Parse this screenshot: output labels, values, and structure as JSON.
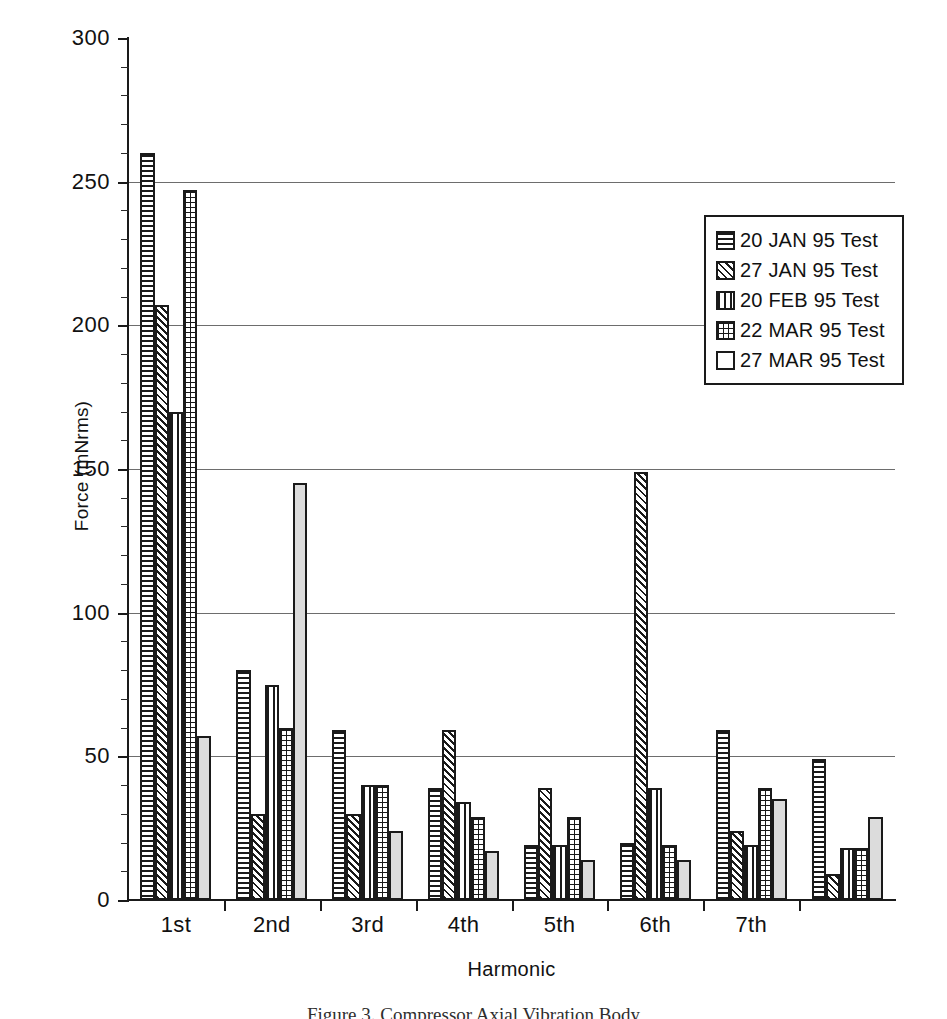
{
  "chart_data": {
    "type": "bar",
    "title": "",
    "xlabel": "Harmonic",
    "ylabel": "Force (mNrms)",
    "ylim": [
      0,
      300
    ],
    "ytick_values": [
      0,
      50,
      100,
      150,
      200,
      250,
      300
    ],
    "ytick_labels": [
      "0",
      "50",
      "100",
      "150",
      "200",
      "250",
      "300"
    ],
    "ytick_minor_step": 10,
    "grid": "horizontal",
    "legend_position": "upper-right",
    "categories": [
      "1st",
      "2nd",
      "3rd",
      "4th",
      "5th",
      "6th",
      "7th",
      ""
    ],
    "series": [
      {
        "name": "20 JAN 95 Test",
        "pattern": "horizontal-lines",
        "values": [
          260,
          80,
          59,
          39,
          19,
          20,
          59,
          49
        ]
      },
      {
        "name": "27 JAN 95 Test",
        "pattern": "diagonal-hatch",
        "values": [
          207,
          30,
          30,
          59,
          39,
          149,
          24,
          9
        ]
      },
      {
        "name": "20 FEB 95 Test",
        "pattern": "vertical-lines",
        "values": [
          170,
          75,
          40,
          34,
          19,
          39,
          19,
          18
        ]
      },
      {
        "name": "22 MAR 95 Test",
        "pattern": "crosshatch-grid",
        "values": [
          247,
          60,
          40,
          29,
          29,
          19,
          39,
          18
        ]
      },
      {
        "name": "27 MAR 95 Test",
        "pattern": "solid-light-gray",
        "values": [
          57,
          145,
          24,
          17,
          14,
          14,
          35,
          29
        ]
      }
    ]
  },
  "legend": {
    "entries": [
      {
        "label": "20 JAN 95 Test",
        "pattern": "horizontal-lines"
      },
      {
        "label": "27 JAN 95 Test",
        "pattern": "diagonal-hatch"
      },
      {
        "label": "20 FEB 95 Test",
        "pattern": "vertical-lines"
      },
      {
        "label": "22 MAR 95 Test",
        "pattern": "crosshatch-grid"
      },
      {
        "label": "27 MAR 95 Test",
        "pattern": "solid-light-gray"
      }
    ]
  },
  "caption": "Figure 3.  Compressor Axial Vibration Body",
  "colors": {
    "ink": "#1a1a1a",
    "gridline": "#6d6d6d",
    "light_fill": "#dcdcdc",
    "background": "#ffffff"
  }
}
